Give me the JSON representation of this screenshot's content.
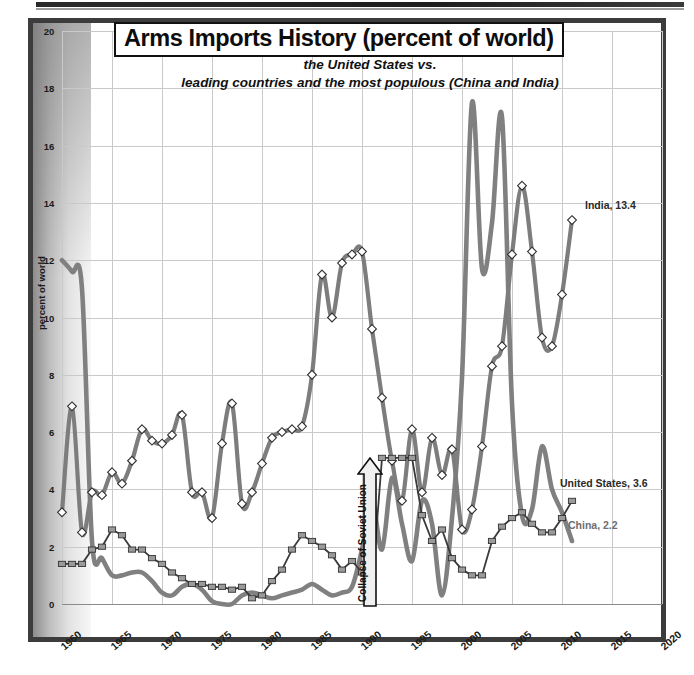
{
  "title": "Arms Imports History (percent of world)",
  "subtitle_line1": "the United States vs.",
  "subtitle_line2": "leading countries and the most populous (China and India)",
  "annotations": {
    "india": "India, 13.4",
    "united_states": "United States, 3.6",
    "china": "China, 2.2",
    "ussr": "Collapse of Soviet Union"
  },
  "colors": {
    "india_line": "#808080",
    "us_line": "#7d7d7d",
    "us_marker_fill": "#ffffff",
    "china_line": "#3a3a3a",
    "china_marker_fill": "#9a9a9a",
    "grid": "#c9c9c9",
    "frame": "#3c3c3c",
    "text": "#111111"
  },
  "chart_data": {
    "type": "line",
    "title": "Arms Imports History (percent of world)",
    "subtitle": "the United States vs. leading countries and the most populous (China and India)",
    "xlabel": "",
    "ylabel": "percent of world",
    "xlim": [
      1960,
      2020
    ],
    "ylim": [
      0,
      20
    ],
    "xticks": [
      1960,
      1965,
      1970,
      1975,
      1980,
      1985,
      1990,
      1995,
      2000,
      2005,
      2010,
      2015,
      2020
    ],
    "yticks": [
      0,
      2,
      4,
      6,
      8,
      10,
      12,
      14,
      16,
      18,
      20
    ],
    "grid": true,
    "legend": "inline-annotations",
    "series": [
      {
        "name": "United States",
        "marker": "diamond-open",
        "last_value": 3.6,
        "x": [
          1960,
          1961,
          1962,
          1963,
          1964,
          1965,
          1966,
          1967,
          1968,
          1969,
          1970,
          1971,
          1972,
          1973,
          1974,
          1975,
          1976,
          1977,
          1978,
          1979,
          1980,
          1981,
          1982,
          1983,
          1984,
          1985,
          1986,
          1987,
          1988,
          1989,
          1990,
          1991,
          1992,
          1993,
          1994,
          1995,
          1996,
          1997,
          1998,
          1999,
          2000,
          2001,
          2002,
          2003,
          2004,
          2005,
          2006,
          2007,
          2008,
          2009,
          2010,
          2011
        ],
        "y": [
          3.2,
          6.9,
          2.5,
          3.9,
          3.8,
          4.6,
          4.2,
          5.0,
          6.1,
          5.7,
          5.6,
          5.9,
          6.6,
          3.9,
          3.9,
          3.0,
          5.6,
          7.0,
          3.5,
          3.9,
          4.9,
          5.8,
          6.0,
          6.1,
          6.2,
          8.0,
          11.5,
          10.0,
          11.9,
          12.2,
          12.3,
          9.6,
          7.2,
          5.0,
          3.6,
          6.1,
          3.9,
          5.8,
          4.5,
          5.4,
          2.6,
          3.3,
          5.5,
          8.3,
          9.0,
          12.2,
          14.6,
          12.3,
          9.3,
          9.0,
          10.8,
          13.4
        ]
      },
      {
        "name": "China",
        "marker": "square",
        "last_value": 2.2,
        "x": [
          1960,
          1961,
          1962,
          1963,
          1964,
          1965,
          1966,
          1967,
          1968,
          1969,
          1970,
          1971,
          1972,
          1973,
          1974,
          1975,
          1976,
          1977,
          1978,
          1979,
          1980,
          1981,
          1982,
          1983,
          1984,
          1985,
          1986,
          1987,
          1988,
          1989,
          1990,
          1991,
          1992,
          1993,
          1994,
          1995,
          1996,
          1997,
          1998,
          1999,
          2000,
          2001,
          2002,
          2003,
          2004,
          2005,
          2006,
          2007,
          2008,
          2009,
          2010,
          2011
        ],
        "y": [
          1.4,
          1.4,
          1.4,
          1.9,
          2.0,
          2.6,
          2.4,
          1.9,
          1.9,
          1.6,
          1.4,
          1.1,
          0.9,
          0.7,
          0.7,
          0.6,
          0.6,
          0.5,
          0.6,
          0.2,
          0.3,
          0.8,
          1.2,
          1.9,
          2.4,
          2.2,
          2.0,
          1.7,
          1.2,
          1.5,
          1.1,
          0.6,
          5.1,
          5.1,
          5.1,
          5.1,
          3.1,
          2.2,
          2.6,
          1.6,
          1.2,
          1.0,
          1.0,
          2.2,
          2.7,
          3.0,
          3.2,
          2.8,
          2.5,
          2.5,
          3.0,
          3.6
        ]
      },
      {
        "name": "India",
        "marker": "none",
        "last_value": 2.2,
        "x": [
          1960,
          1961,
          1962,
          1963,
          1964,
          1965,
          1966,
          1967,
          1968,
          1969,
          1970,
          1971,
          1972,
          1973,
          1974,
          1975,
          1976,
          1977,
          1978,
          1979,
          1980,
          1981,
          1982,
          1983,
          1984,
          1985,
          1986,
          1987,
          1988,
          1989,
          1990,
          1991,
          1992,
          1993,
          1994,
          1995,
          1996,
          1997,
          1998,
          1999,
          2000,
          2001,
          2002,
          2003,
          2004,
          2005,
          2006,
          2007,
          2008,
          2009,
          2010,
          2011
        ],
        "y": [
          12.0,
          11.6,
          11.0,
          2.2,
          1.6,
          1.0,
          1.0,
          1.1,
          1.1,
          0.8,
          0.4,
          0.3,
          0.6,
          0.7,
          0.5,
          0.1,
          0.0,
          0.0,
          0.3,
          0.4,
          0.3,
          0.2,
          0.3,
          0.4,
          0.5,
          0.7,
          0.5,
          0.3,
          0.4,
          0.6,
          1.9,
          3.6,
          1.9,
          4.4,
          2.8,
          1.5,
          3.6,
          2.8,
          0.3,
          3.0,
          7.9,
          17.5,
          11.7,
          13.3,
          17.0,
          7.0,
          3.1,
          3.3,
          5.5,
          4.0,
          3.2,
          2.2
        ]
      }
    ]
  },
  "axis": {
    "y_tick_labels": [
      "0",
      "2",
      "4",
      "6",
      "8",
      "10",
      "12",
      "14",
      "16",
      "18",
      "20"
    ],
    "x_tick_labels": [
      "1960",
      "1965",
      "1970",
      "1975",
      "1980",
      "1985",
      "1990",
      "1995",
      "2000",
      "2005",
      "2010",
      "2015",
      "2020"
    ]
  }
}
